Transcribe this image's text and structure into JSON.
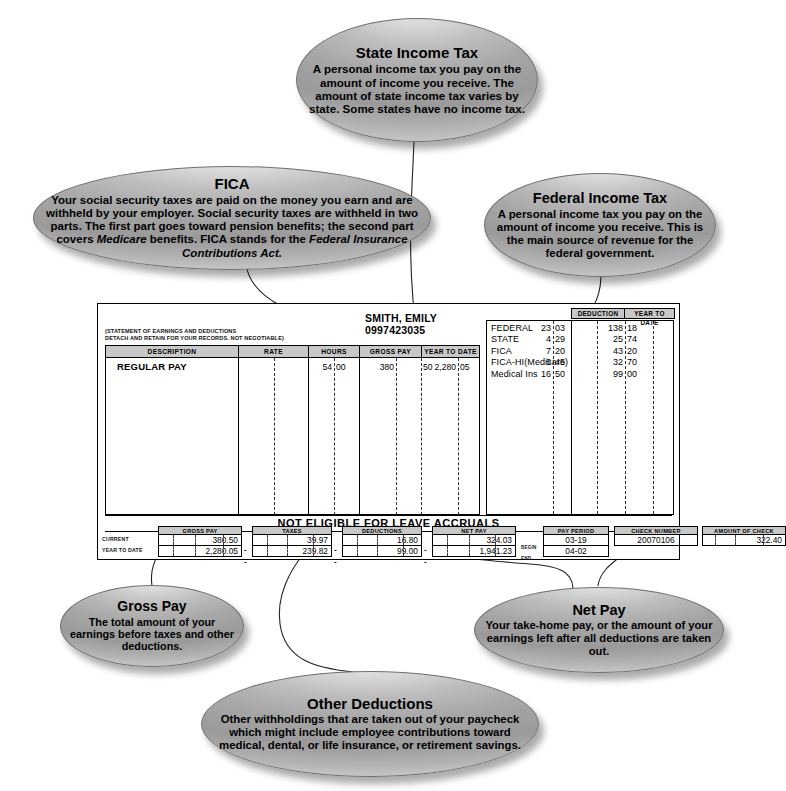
{
  "callouts": {
    "state_income_tax": {
      "title": "State Income Tax",
      "body": "A personal income tax you pay on the amount of income you receive. The amount of state income tax varies by state. Some states have no income tax."
    },
    "fica": {
      "title": "FICA",
      "body_part1": "Your social security taxes are paid on the money you earn and are withheld by your employer. Social security taxes are withheld in two parts. The first part goes toward pension benefits; the second part covers ",
      "body_italic1": "Medicare",
      "body_part2": " benefits. FICA stands for the ",
      "body_italic2": "Federal Insurance Contributions Act."
    },
    "federal_income_tax": {
      "title": "Federal Income Tax",
      "body": "A personal income tax you pay on the amount of income you receive. This is the main source of revenue for the federal government."
    },
    "gross_pay": {
      "title": "Gross Pay",
      "body": "The total amount of your earnings before taxes and other deductions."
    },
    "net_pay": {
      "title": "Net Pay",
      "body": "Your take-home pay, or the amount of your earnings left after all deductions are taken out."
    },
    "other_deductions": {
      "title": "Other Deductions",
      "body": "Other withholdings that are taken out of your paycheck which might include employee contributions toward medical, dental, or life insurance, or retirement savings."
    }
  },
  "paystub": {
    "employee_name": "SMITH, EMILY",
    "employee_id": "0997423035",
    "legal_line1": "(STATEMENT OF EARNINGS AND DEDUCTIONS",
    "legal_line2": "DETACH AND RETAIN FOR YOUR RECORDS. NOT NEGOTIABLE)",
    "earnings": {
      "headers": [
        "DESCRIPTION",
        "RATE",
        "HOURS",
        "GROSS PAY",
        "YEAR TO DATE"
      ],
      "rows": [
        {
          "description": "REGULAR PAY",
          "rate": "",
          "hours_dollars": "54",
          "hours_cents": "00",
          "gross_dollars": "380",
          "gross_cents": "50",
          "ytd_dollars": "2,280",
          "ytd_cents": "05"
        }
      ]
    },
    "deductions": {
      "headers": [
        "DEDUCTION",
        "YEAR TO DATE"
      ],
      "rows": [
        {
          "name": "FEDERAL",
          "ded_dollars": "23",
          "ded_cents": "03",
          "ytd_dollars": "138",
          "ytd_cents": "18"
        },
        {
          "name": "STATE",
          "ded_dollars": "4",
          "ded_cents": "29",
          "ytd_dollars": "25",
          "ytd_cents": "74"
        },
        {
          "name": "FICA",
          "ded_dollars": "7",
          "ded_cents": "20",
          "ytd_dollars": "43",
          "ytd_cents": "20"
        },
        {
          "name": "FICA-HI(Medicare)",
          "ded_dollars": "5",
          "ded_cents": "45",
          "ytd_dollars": "32",
          "ytd_cents": "70"
        },
        {
          "name": "Medical Ins",
          "ded_dollars": "16",
          "ded_cents": "50",
          "ytd_dollars": "99",
          "ytd_cents": "00"
        }
      ]
    },
    "notice": "NOT ELIGIBLE FOR LEAVE ACCRUALS",
    "summary": {
      "row_label_current": "CURRENT",
      "row_label_ytd": "YEAR TO DATE",
      "label_begin": "BEGIN",
      "label_end": "END",
      "separator": "-",
      "gross_pay": {
        "header": "GROSS PAY",
        "current": "380.50",
        "ytd": "2,280.05"
      },
      "taxes": {
        "header": "TAXES",
        "current": "39.97",
        "ytd": "239.82"
      },
      "deductions": {
        "header": "DEDUCTIONS",
        "current": "16.80",
        "ytd": "99.00"
      },
      "net_pay": {
        "header": "NET PAY",
        "current": "324.03",
        "ytd": "1,941.23"
      },
      "pay_period": {
        "header": "PAY PERIOD",
        "begin": "03-19",
        "end": "04-02"
      },
      "check_number": {
        "header": "CHECK NUMBER",
        "value": "20070106"
      },
      "amount_of_check": {
        "header": "AMOUNT OF CHECK",
        "value": "322.40"
      }
    }
  },
  "colors": {
    "table_header_gray": "#c8c8c8",
    "oval_mid_gray": "#a6a6a6",
    "ink": "#000000"
  }
}
